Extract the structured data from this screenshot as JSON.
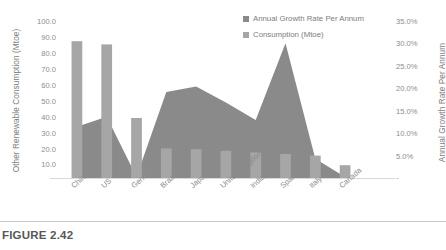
{
  "caption": "FIGURE 2.42",
  "colors": {
    "bar": "#a6a6a6",
    "area": "#8a8a8a",
    "text": "#808080",
    "baseline": "#d9d9d9",
    "background": "#ffffff"
  },
  "legend": {
    "position": "top-right",
    "items": [
      {
        "label": "Annual Growth Rate Per Annum",
        "color": "#8a8a8a",
        "marker": "square-swatch"
      },
      {
        "label": "Consumption (Mtoe)",
        "color": "#a6a6a6",
        "marker": "square-swatch"
      }
    ]
  },
  "axes": {
    "left": {
      "title": "Other Renewable Consumption (Mtoe)",
      "ticks": [
        "100.0",
        "90.0",
        "80.0",
        "70.0",
        "60.0",
        "50.0",
        "40.0",
        "30.0",
        "20.0",
        "10.0",
        "-"
      ],
      "min": 0,
      "max": 100
    },
    "right": {
      "title": "Annual Growth Rate Per Annum",
      "ticks": [
        "35.0%",
        "30.0%",
        "25.0%",
        "20.0%",
        "15.0%",
        "10.0%",
        "5.0%",
        "-"
      ],
      "min": 0,
      "max": 35
    }
  },
  "chart_data": {
    "type": "bar",
    "title": "FIGURE 2.42",
    "xlabel": "",
    "ylabel": "Other Renewable Consumption (Mtoe)",
    "y2label": "Annual Growth Rate Per Annum",
    "ylim": [
      0,
      100
    ],
    "y2lim": [
      0,
      35
    ],
    "grid": false,
    "legend_position": "top-right",
    "categories": [
      "China",
      "US",
      "Germany",
      "Brazil",
      "Japan",
      "United Kingdom",
      "India",
      "Spain",
      "Italy",
      "Canada"
    ],
    "series": [
      {
        "name": "Consumption (Mtoe)",
        "type": "bar",
        "axis": "left",
        "unit": "Mtoe",
        "color": "#a6a6a6",
        "values": [
          85.5,
          83.5,
          37.5,
          18.5,
          18.0,
          17.0,
          16.0,
          15.0,
          14.0,
          8.0
        ]
      },
      {
        "name": "Annual Growth Rate Per Annum",
        "type": "area",
        "axis": "right",
        "unit": "%",
        "color": "#8a8a8a",
        "values": [
          11.2,
          13.4,
          0.3,
          18.8,
          20.0,
          16.5,
          12.7,
          29.5,
          4.2,
          0.2
        ]
      }
    ]
  }
}
